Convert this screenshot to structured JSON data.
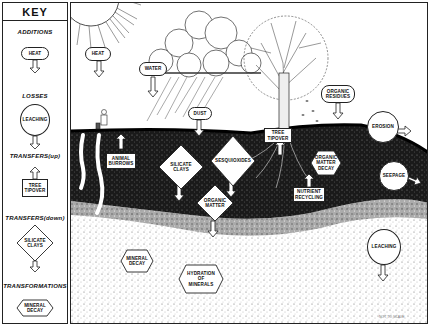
{
  "key": {
    "title": "KEY",
    "sections": [
      {
        "heading": "ADDITIONS",
        "example": "HEAT",
        "shape": "pill",
        "arrow": "down"
      },
      {
        "heading": "LOSSES",
        "example": "LEACHING",
        "shape": "circle",
        "arrow": "down"
      },
      {
        "heading": "TRANSFERS(up)",
        "example_line1": "TREE",
        "example_line2": "TIPOVER",
        "shape": "rectangle",
        "arrow": "up"
      },
      {
        "heading": "TRANSFERS(down)",
        "example_line1": "SILICATE",
        "example_line2": "CLAYS",
        "shape": "diamond",
        "arrow": "down"
      },
      {
        "heading": "TRANSFORMATIONS",
        "example_line1": "MINERAL",
        "example_line2": "DECAY",
        "shape": "hexagon",
        "arrow": "none"
      }
    ]
  },
  "scene": {
    "additions": [
      {
        "label": "HEAT"
      },
      {
        "label": "WATER"
      },
      {
        "label": "DUST"
      },
      {
        "label_line1": "ORGANIC",
        "label_line2": "RESIDUES"
      }
    ],
    "losses": [
      {
        "label": "EROSION"
      },
      {
        "label": "SEEPAGE"
      },
      {
        "label": "LEACHING"
      }
    ],
    "transfers_up": [
      {
        "label_line1": "ANIMAL",
        "label_line2": "BURROWS"
      },
      {
        "label_line1": "TREE",
        "label_line2": "TIPOVER"
      },
      {
        "label_line1": "NUTRIENT",
        "label_line2": "RECYCLING"
      }
    ],
    "transfers_down": [
      {
        "label_line1": "SILICATE",
        "label_line2": "CLAYS"
      },
      {
        "label": "SESQUIOXIDES"
      },
      {
        "label_line1": "ORGANIC",
        "label_line2": "MATTER"
      }
    ],
    "transformations": [
      {
        "label_line1": "ORGANIC",
        "label_line2": "MATTER",
        "label_line3": "DECAY"
      },
      {
        "label_line1": "MINERAL",
        "label_line2": "DECAY"
      },
      {
        "label_line1": "HYDRATION",
        "label_line2": "OF",
        "label_line3": "MINERALS"
      }
    ],
    "note": "NOT TO SCALE"
  }
}
